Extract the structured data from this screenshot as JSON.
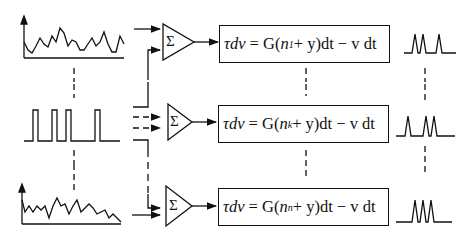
{
  "diagram": {
    "title": "",
    "rows": [
      {
        "input_signal": "noisy-analog-signal",
        "summer_symbol": "Σ",
        "equation": {
          "lhs": "τdv",
          "eq": "=",
          "g": "G(",
          "n": "n",
          "sub": "1",
          "rest": " + y)dt − v dt"
        },
        "output_signal": "spike-train"
      },
      {
        "input_signal": "pulse-train",
        "summer_symbol": "Σ",
        "equation": {
          "lhs": "τdv",
          "eq": "=",
          "g": "G(",
          "n": "n",
          "sub": "k",
          "rest": " + y)dt − v dt"
        },
        "output_signal": "spike-train"
      },
      {
        "input_signal": "noisy-analog-signal",
        "summer_symbol": "Σ",
        "equation": {
          "lhs": "τdv",
          "eq": "=",
          "g": "G(",
          "n": "n",
          "sub": "n",
          "rest": " + y)dt − v dt"
        },
        "output_signal": "spike-train"
      }
    ],
    "colors": {
      "stroke": "#111111",
      "background": "#ffffff"
    }
  }
}
